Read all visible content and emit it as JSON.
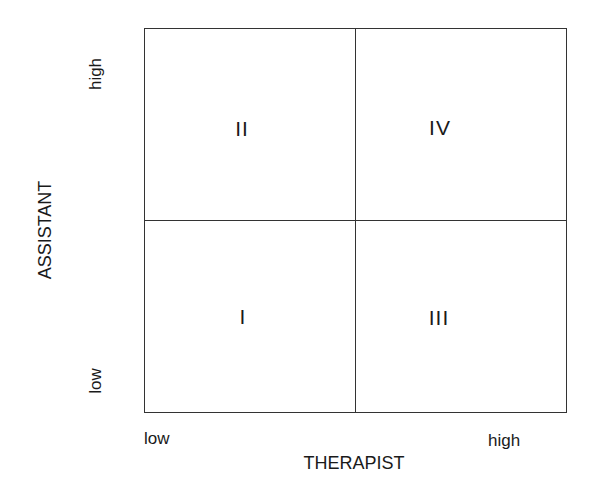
{
  "diagram": {
    "type": "2x2 quadrant matrix",
    "x_axis": {
      "title": "THERAPIST",
      "low_label": "low",
      "high_label": "high"
    },
    "y_axis": {
      "title": "ASSISTANT",
      "low_label": "low",
      "high_label": "high"
    },
    "quadrants": {
      "top_left": "II",
      "top_right": "IV",
      "bottom_left": "I",
      "bottom_right": "III"
    },
    "colors": {
      "line": "#333333",
      "text": "#1a1a1a",
      "background": "#ffffff"
    }
  }
}
